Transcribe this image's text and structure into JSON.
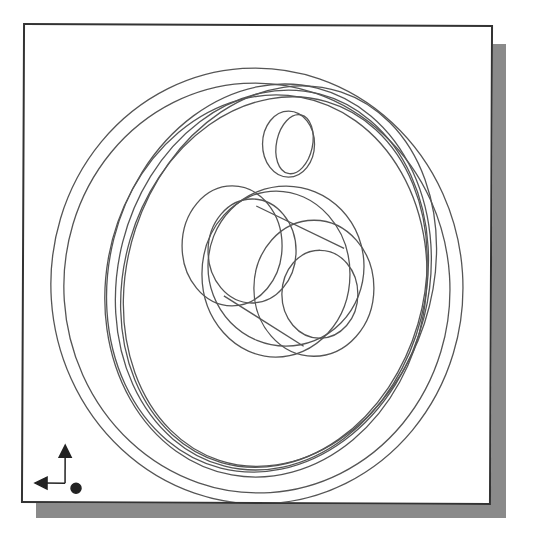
{
  "figure": {
    "kind": "cad-wireframe-viewport",
    "line_color": "#555555",
    "frame_color": "#333333",
    "shadow_color": "#8a8a8a",
    "background": "#ffffff"
  },
  "triad": {
    "icon": "axis-triad-icon",
    "axes": [
      "up-arrow",
      "left-arrow",
      "out-of-screen-dot"
    ]
  }
}
